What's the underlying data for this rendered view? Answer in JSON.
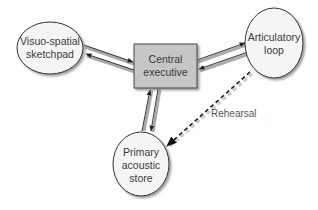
{
  "diagram": {
    "type": "working-memory-model",
    "colors": {
      "box_fill": "#c6c6c6",
      "ellipse_fill": "#f5f5f5",
      "stroke": "#333333",
      "shadow": "#9a9a9a",
      "dashed": "#222222"
    },
    "nodes": {
      "central": {
        "shape": "rectangle",
        "lines": [
          "Central",
          "executive"
        ]
      },
      "visuo": {
        "shape": "ellipse",
        "lines": [
          "Visuo-spatial",
          "sketchpad"
        ]
      },
      "articulatory": {
        "shape": "ellipse",
        "lines": [
          "Articulatory",
          "loop"
        ]
      },
      "primary": {
        "shape": "ellipse",
        "lines": [
          "Primary",
          "acoustic",
          "store"
        ]
      }
    },
    "edges": [
      {
        "from": "visuo",
        "to": "central",
        "style": "solid"
      },
      {
        "from": "central",
        "to": "visuo",
        "style": "solid"
      },
      {
        "from": "central",
        "to": "articulatory",
        "style": "solid"
      },
      {
        "from": "articulatory",
        "to": "central",
        "style": "solid"
      },
      {
        "from": "primary",
        "to": "central",
        "style": "solid"
      },
      {
        "from": "central",
        "to": "primary",
        "style": "solid"
      },
      {
        "from": "articulatory",
        "to": "primary",
        "style": "dashed",
        "label": "Rehearsal"
      }
    ],
    "labels": {
      "rehearsal": "Rehearsal"
    }
  }
}
